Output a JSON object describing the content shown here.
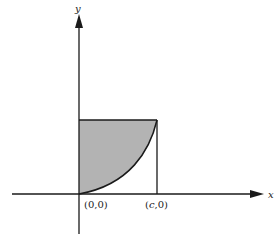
{
  "figure": {
    "axes": {
      "x_label": "x",
      "y_label": "y"
    },
    "points": [
      {
        "label": "(0,0)",
        "x": 0,
        "y": 0
      },
      {
        "label": "(c,0)",
        "x": "c",
        "y": 0
      }
    ],
    "origin_label": "(0,0)",
    "c_label": "(c,",
    "c_label_tail": "0)",
    "c_label_c": "c",
    "c_label_open": "(",
    "c_label_close": ",0)",
    "shaded_region": "area between y-axis, top of rectangle and the increasing curve from (0,0) to (c, top)",
    "colors": {
      "shade": "#b3b3b3",
      "line": "#1a1a1a",
      "background": "#ffffff"
    }
  }
}
